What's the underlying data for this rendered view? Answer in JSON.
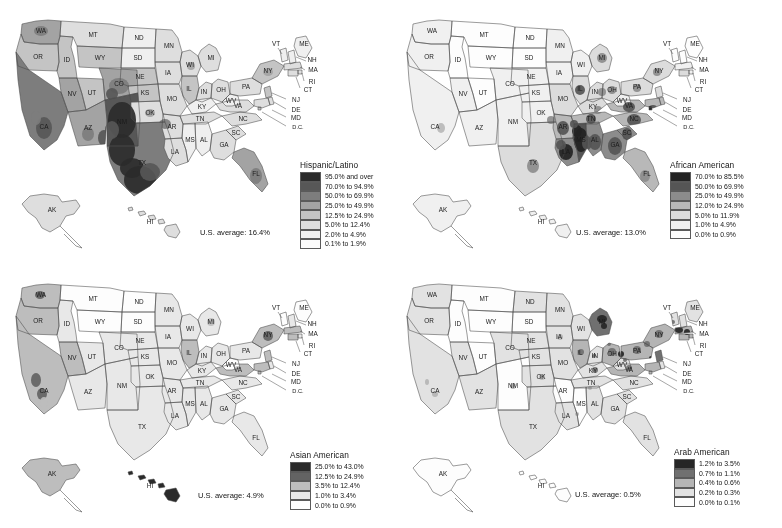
{
  "figure": {
    "width": 782,
    "height": 528,
    "background": "#ffffff",
    "layout": "2x2 grid of choropleth maps of the United States"
  },
  "chart_data": {
    "type": "map",
    "subtype": "choropleth",
    "title": "",
    "region": "United States (county level, with Alaska and Hawaii insets)",
    "panels": [
      {
        "id": "hispanic-latino",
        "legend_title": "Hispanic/Latino",
        "us_average_label": "U.S. average: 16.4%",
        "us_average_value": 16.4,
        "units": "percent of population",
        "bins": [
          {
            "label": "95.0% and over",
            "color": "#2b2b2b",
            "min": 95.0,
            "max": null
          },
          {
            "label": "70.0% to 94.9%",
            "color": "#575757",
            "min": 70.0,
            "max": 94.9
          },
          {
            "label": "50.0% to 69.9%",
            "color": "#7d7d7d",
            "min": 50.0,
            "max": 69.9
          },
          {
            "label": "25.0% to 49.9%",
            "color": "#a3a3a3",
            "min": 25.0,
            "max": 49.9
          },
          {
            "label": "12.5% to 24.9%",
            "color": "#c4c4c4",
            "min": 12.5,
            "max": 24.9
          },
          {
            "label": "5.0% to 12.4%",
            "color": "#dedede",
            "min": 5.0,
            "max": 12.4
          },
          {
            "label": "2.0% to 4.9%",
            "color": "#efefef",
            "min": 2.0,
            "max": 4.9
          },
          {
            "label": "0.1% to 1.9%",
            "color": "#fbfbfb",
            "min": 0.1,
            "max": 1.9
          }
        ],
        "highlight_regions": [
          "South Texas",
          "New Mexico",
          "Southern California",
          "Arizona border counties",
          "Southern Colorado",
          "Central Washington",
          "Southern Florida"
        ]
      },
      {
        "id": "african-american",
        "legend_title": "African American",
        "us_average_label": "U.S. average: 13.0%",
        "us_average_value": 13.0,
        "units": "percent of population",
        "bins": [
          {
            "label": "70.0% to 85.5%",
            "color": "#232323",
            "min": 70.0,
            "max": 85.5
          },
          {
            "label": "50.0% to 69.9%",
            "color": "#555555",
            "min": 50.0,
            "max": 69.9
          },
          {
            "label": "25.0% to 49.9%",
            "color": "#8c8c8c",
            "min": 25.0,
            "max": 49.9
          },
          {
            "label": "12.0% to 24.9%",
            "color": "#b8b8b8",
            "min": 12.0,
            "max": 24.9
          },
          {
            "label": "5.0% to 11.9%",
            "color": "#dcdcdc",
            "min": 5.0,
            "max": 11.9
          },
          {
            "label": "1.0% to 4.9%",
            "color": "#f0f0f0",
            "min": 1.0,
            "max": 4.9
          },
          {
            "label": "0.0% to 0.9%",
            "color": "#fdfdfd",
            "min": 0.0,
            "max": 0.9
          }
        ],
        "highlight_regions": [
          "Mississippi Delta",
          "Alabama Black Belt",
          "Louisiana",
          "Eastern Virginia and Carolinas",
          "Georgia",
          "Memphis region"
        ]
      },
      {
        "id": "asian-american",
        "legend_title": "Asian American",
        "us_average_label": "U.S. average: 4.9%",
        "us_average_value": 4.9,
        "units": "percent of population",
        "bins": [
          {
            "label": "25.0% to 43.0%",
            "color": "#2a2a2a",
            "min": 25.0,
            "max": 43.0
          },
          {
            "label": "12.5% to 24.9%",
            "color": "#636363",
            "min": 12.5,
            "max": 24.9
          },
          {
            "label": "3.5% to 12.4%",
            "color": "#bdbdbd",
            "min": 3.5,
            "max": 12.4
          },
          {
            "label": "1.0% to 3.4%",
            "color": "#e8e8e8",
            "min": 1.0,
            "max": 3.4
          },
          {
            "label": "0.0% to 0.9%",
            "color": "#fdfdfd",
            "min": 0.0,
            "max": 0.9
          }
        ],
        "highlight_regions": [
          "Hawaii",
          "San Francisco Bay Area",
          "Los Angeles",
          "Seattle",
          "New York City",
          "Northern Virginia"
        ]
      },
      {
        "id": "arab-american",
        "legend_title": "Arab American",
        "us_average_label": "U.S. average: 0.5%",
        "us_average_value": 0.5,
        "units": "percent of population",
        "bins": [
          {
            "label": "1.2% to 3.5%",
            "color": "#262626",
            "min": 1.2,
            "max": 3.5
          },
          {
            "label": "0.7% to 1.1%",
            "color": "#707070",
            "min": 0.7,
            "max": 1.1
          },
          {
            "label": "0.4% to 0.6%",
            "color": "#b5b5b5",
            "min": 0.4,
            "max": 0.6
          },
          {
            "label": "0.2% to 0.3%",
            "color": "#e2e2e2",
            "min": 0.2,
            "max": 0.3
          },
          {
            "label": "0.0% to 0.1%",
            "color": "#fdfdfd",
            "min": 0.0,
            "max": 0.1
          }
        ],
        "highlight_regions": [
          "Detroit Michigan",
          "Northeast corridor",
          "Ohio",
          "Northern New Jersey",
          "Central California"
        ]
      }
    ],
    "state_labels": [
      "WA",
      "OR",
      "ID",
      "MT",
      "ND",
      "MN",
      "WI",
      "MI",
      "NY",
      "VT",
      "ME",
      "NH",
      "MA",
      "RI",
      "CT",
      "SD",
      "WY",
      "NE",
      "IA",
      "IL",
      "IN",
      "OH",
      "PA",
      "NJ",
      "DE",
      "MD",
      "D.C.",
      "VA",
      "WV",
      "NV",
      "UT",
      "CO",
      "KS",
      "MO",
      "KY",
      "TN",
      "NC",
      "SC",
      "GA",
      "FL",
      "AL",
      "MS",
      "AR",
      "LA",
      "CA",
      "AZ",
      "NM",
      "OK",
      "TX",
      "AK",
      "HI"
    ]
  },
  "legends": {
    "hispanic": {
      "title": "Hispanic/Latino",
      "average": "U.S. average: 16.4%",
      "rows": [
        {
          "label": "95.0% and over",
          "color": "#2b2b2b"
        },
        {
          "label": "70.0% to 94.9%",
          "color": "#575757"
        },
        {
          "label": "50.0% to 69.9%",
          "color": "#7d7d7d"
        },
        {
          "label": "25.0% to 49.9%",
          "color": "#a3a3a3"
        },
        {
          "label": "12.5% to 24.9%",
          "color": "#c4c4c4"
        },
        {
          "label": "5.0% to 12.4%",
          "color": "#dedede"
        },
        {
          "label": "2.0% to 4.9%",
          "color": "#efefef"
        },
        {
          "label": "0.1% to 1.9%",
          "color": "#fbfbfb"
        }
      ]
    },
    "african": {
      "title": "African American",
      "average": "U.S. average: 13.0%",
      "rows": [
        {
          "label": "70.0% to 85.5%",
          "color": "#232323"
        },
        {
          "label": "50.0% to 69.9%",
          "color": "#555555"
        },
        {
          "label": "25.0% to 49.9%",
          "color": "#8c8c8c"
        },
        {
          "label": "12.0% to 24.9%",
          "color": "#b8b8b8"
        },
        {
          "label": "5.0% to 11.9%",
          "color": "#dcdcdc"
        },
        {
          "label": "1.0% to 4.9%",
          "color": "#f0f0f0"
        },
        {
          "label": "0.0% to 0.9%",
          "color": "#fdfdfd"
        }
      ]
    },
    "asian": {
      "title": "Asian American",
      "average": "U.S. average: 4.9%",
      "rows": [
        {
          "label": "25.0% to 43.0%",
          "color": "#2a2a2a"
        },
        {
          "label": "12.5% to 24.9%",
          "color": "#636363"
        },
        {
          "label": "3.5% to 12.4%",
          "color": "#bdbdbd"
        },
        {
          "label": "1.0% to 3.4%",
          "color": "#e8e8e8"
        },
        {
          "label": "0.0% to 0.9%",
          "color": "#fdfdfd"
        }
      ]
    },
    "arab": {
      "title": "Arab American",
      "average": "U.S. average: 0.5%",
      "rows": [
        {
          "label": "1.2% to 3.5%",
          "color": "#262626"
        },
        {
          "label": "0.7% to 1.1%",
          "color": "#707070"
        },
        {
          "label": "0.4% to 0.6%",
          "color": "#b5b5b5"
        },
        {
          "label": "0.2% to 0.3%",
          "color": "#e2e2e2"
        },
        {
          "label": "0.0% to 0.1%",
          "color": "#fdfdfd"
        }
      ]
    }
  }
}
